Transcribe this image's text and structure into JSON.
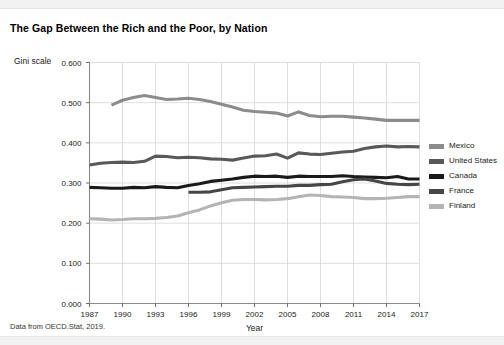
{
  "title": "The Gap Between the Rich and the Poor, by Nation",
  "y_axis_caption": "Gini scale",
  "footer": "Data from OECD.Stat, 2019.",
  "legend": {
    "position": "right",
    "items": [
      {
        "label": "Mexico",
        "color": "#8c8c8c"
      },
      {
        "label": "United States",
        "color": "#595959"
      },
      {
        "label": "Canada",
        "color": "#1a1a1a"
      },
      {
        "label": "France",
        "color": "#464646"
      },
      {
        "label": "Finland",
        "color": "#b4b4b4"
      }
    ]
  },
  "chart_data": {
    "type": "line",
    "title": "The Gap Between the Rich and the Poor, by Nation",
    "xlabel": "Year",
    "ylabel": "Gini scale",
    "xlim": [
      1987,
      2017
    ],
    "ylim": [
      0.0,
      0.6
    ],
    "grid": true,
    "x_ticks": [
      1987,
      1990,
      1993,
      1996,
      1999,
      2002,
      2005,
      2008,
      2011,
      2014,
      2017
    ],
    "y_ticks": [
      "0.000",
      "0.100",
      "0.200",
      "0.300",
      "0.400",
      "0.500",
      "0.600"
    ],
    "series": [
      {
        "name": "Mexico",
        "color": "#8c8c8c",
        "points": [
          [
            1989,
            0.494
          ],
          [
            1990,
            0.506
          ],
          [
            1991,
            0.513
          ],
          [
            1992,
            0.518
          ],
          [
            1993,
            0.513
          ],
          [
            1994,
            0.508
          ],
          [
            1995,
            0.509
          ],
          [
            1996,
            0.511
          ],
          [
            1997,
            0.508
          ],
          [
            1998,
            0.503
          ],
          [
            1999,
            0.496
          ],
          [
            2000,
            0.489
          ],
          [
            2001,
            0.481
          ],
          [
            2002,
            0.478
          ],
          [
            2003,
            0.476
          ],
          [
            2004,
            0.474
          ],
          [
            2005,
            0.467
          ],
          [
            2006,
            0.477
          ],
          [
            2007,
            0.468
          ],
          [
            2008,
            0.465
          ],
          [
            2009,
            0.466
          ],
          [
            2010,
            0.466
          ],
          [
            2011,
            0.464
          ],
          [
            2012,
            0.462
          ],
          [
            2013,
            0.459
          ],
          [
            2014,
            0.456
          ],
          [
            2015,
            0.456
          ],
          [
            2016,
            0.456
          ],
          [
            2017,
            0.456
          ]
        ]
      },
      {
        "name": "United States",
        "color": "#595959",
        "points": [
          [
            1987,
            0.345
          ],
          [
            1988,
            0.349
          ],
          [
            1989,
            0.351
          ],
          [
            1990,
            0.352
          ],
          [
            1991,
            0.351
          ],
          [
            1992,
            0.354
          ],
          [
            1993,
            0.367
          ],
          [
            1994,
            0.366
          ],
          [
            1995,
            0.363
          ],
          [
            1996,
            0.364
          ],
          [
            1997,
            0.363
          ],
          [
            1998,
            0.36
          ],
          [
            1999,
            0.359
          ],
          [
            2000,
            0.357
          ],
          [
            2001,
            0.362
          ],
          [
            2002,
            0.367
          ],
          [
            2003,
            0.368
          ],
          [
            2004,
            0.372
          ],
          [
            2005,
            0.362
          ],
          [
            2006,
            0.375
          ],
          [
            2007,
            0.372
          ],
          [
            2008,
            0.371
          ],
          [
            2009,
            0.374
          ],
          [
            2010,
            0.377
          ],
          [
            2011,
            0.379
          ],
          [
            2012,
            0.386
          ],
          [
            2013,
            0.39
          ],
          [
            2014,
            0.392
          ],
          [
            2015,
            0.39
          ],
          [
            2016,
            0.391
          ],
          [
            2017,
            0.39
          ]
        ]
      },
      {
        "name": "Canada",
        "color": "#1a1a1a",
        "points": [
          [
            1987,
            0.289
          ],
          [
            1988,
            0.288
          ],
          [
            1989,
            0.287
          ],
          [
            1990,
            0.287
          ],
          [
            1991,
            0.289
          ],
          [
            1992,
            0.288
          ],
          [
            1993,
            0.291
          ],
          [
            1994,
            0.289
          ],
          [
            1995,
            0.288
          ],
          [
            1996,
            0.294
          ],
          [
            1997,
            0.298
          ],
          [
            1998,
            0.304
          ],
          [
            1999,
            0.307
          ],
          [
            2000,
            0.31
          ],
          [
            2001,
            0.314
          ],
          [
            2002,
            0.317
          ],
          [
            2003,
            0.316
          ],
          [
            2004,
            0.317
          ],
          [
            2005,
            0.314
          ],
          [
            2006,
            0.317
          ],
          [
            2007,
            0.316
          ],
          [
            2008,
            0.316
          ],
          [
            2009,
            0.316
          ],
          [
            2010,
            0.318
          ],
          [
            2011,
            0.316
          ],
          [
            2012,
            0.315
          ],
          [
            2013,
            0.314
          ],
          [
            2014,
            0.313
          ],
          [
            2015,
            0.316
          ],
          [
            2016,
            0.31
          ],
          [
            2017,
            0.31
          ]
        ]
      },
      {
        "name": "France",
        "color": "#464646",
        "points": [
          [
            1996,
            0.277
          ],
          [
            1997,
            0.277
          ],
          [
            1998,
            0.278
          ],
          [
            1999,
            0.283
          ],
          [
            2000,
            0.288
          ],
          [
            2001,
            0.289
          ],
          [
            2002,
            0.29
          ],
          [
            2003,
            0.291
          ],
          [
            2004,
            0.292
          ],
          [
            2005,
            0.292
          ],
          [
            2006,
            0.294
          ],
          [
            2007,
            0.294
          ],
          [
            2008,
            0.296
          ],
          [
            2009,
            0.297
          ],
          [
            2010,
            0.303
          ],
          [
            2011,
            0.308
          ],
          [
            2012,
            0.31
          ],
          [
            2013,
            0.305
          ],
          [
            2014,
            0.299
          ],
          [
            2015,
            0.297
          ],
          [
            2016,
            0.296
          ],
          [
            2017,
            0.297
          ]
        ]
      },
      {
        "name": "Finland",
        "color": "#b4b4b4",
        "points": [
          [
            1987,
            0.211
          ],
          [
            1988,
            0.21
          ],
          [
            1989,
            0.208
          ],
          [
            1990,
            0.209
          ],
          [
            1991,
            0.211
          ],
          [
            1992,
            0.211
          ],
          [
            1993,
            0.212
          ],
          [
            1994,
            0.214
          ],
          [
            1995,
            0.218
          ],
          [
            1996,
            0.226
          ],
          [
            1997,
            0.233
          ],
          [
            1998,
            0.243
          ],
          [
            1999,
            0.251
          ],
          [
            2000,
            0.257
          ],
          [
            2001,
            0.259
          ],
          [
            2002,
            0.259
          ],
          [
            2003,
            0.258
          ],
          [
            2004,
            0.259
          ],
          [
            2005,
            0.261
          ],
          [
            2006,
            0.266
          ],
          [
            2007,
            0.27
          ],
          [
            2008,
            0.269
          ],
          [
            2009,
            0.266
          ],
          [
            2010,
            0.265
          ],
          [
            2011,
            0.264
          ],
          [
            2012,
            0.261
          ],
          [
            2013,
            0.261
          ],
          [
            2014,
            0.262
          ],
          [
            2015,
            0.264
          ],
          [
            2016,
            0.266
          ],
          [
            2017,
            0.266
          ]
        ]
      }
    ]
  }
}
